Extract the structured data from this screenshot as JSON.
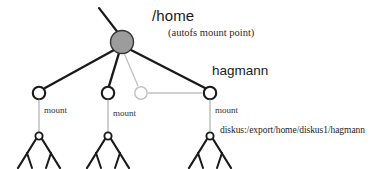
{
  "diagram": {
    "title_visible": "/home",
    "subtitle_visible": "(autofs mount point)",
    "background_color": "#ffffff",
    "colors": {
      "edge_dark": "#1a1a1a",
      "edge_light": "#b9b9b9",
      "node_root_fill": "#9c9c9c",
      "node_root_stroke": "#3a3a3a",
      "node_open_stroke": "#1a1a1a",
      "node_ghost_stroke": "#c2c2c2",
      "text": "#1a1a1a"
    },
    "root": {
      "label": "/home",
      "sublabel": "(autofs mount point)",
      "shape": "filled-circle",
      "fill": "#9c9c9c"
    },
    "children": [
      {
        "id": "child-1",
        "label": "",
        "shape": "open-circle",
        "state": "mounted",
        "connector_label": "mount"
      },
      {
        "id": "child-2",
        "label": "",
        "shape": "open-circle",
        "state": "mounted",
        "connector_label": "mount"
      },
      {
        "id": "child-3",
        "label": "",
        "shape": "ghost-circle",
        "state": "unmounted",
        "connector_label": ""
      },
      {
        "id": "child-4",
        "label": "hagmann",
        "shape": "open-circle",
        "state": "mounted",
        "connector_label": "mount",
        "remote_path": "diskus:/export/home/diskus1/hagmann"
      }
    ],
    "mount_labels": [
      "mount",
      "mount",
      "mount"
    ],
    "remote_path": "diskus:/export/home/diskus1/hagmann",
    "hagmann_label": "hagmann",
    "subtrees": [
      {
        "id": "subtree-1",
        "leaf_count": 4
      },
      {
        "id": "subtree-2",
        "leaf_count": 4
      },
      {
        "id": "subtree-3",
        "leaf_count": 4
      }
    ]
  }
}
